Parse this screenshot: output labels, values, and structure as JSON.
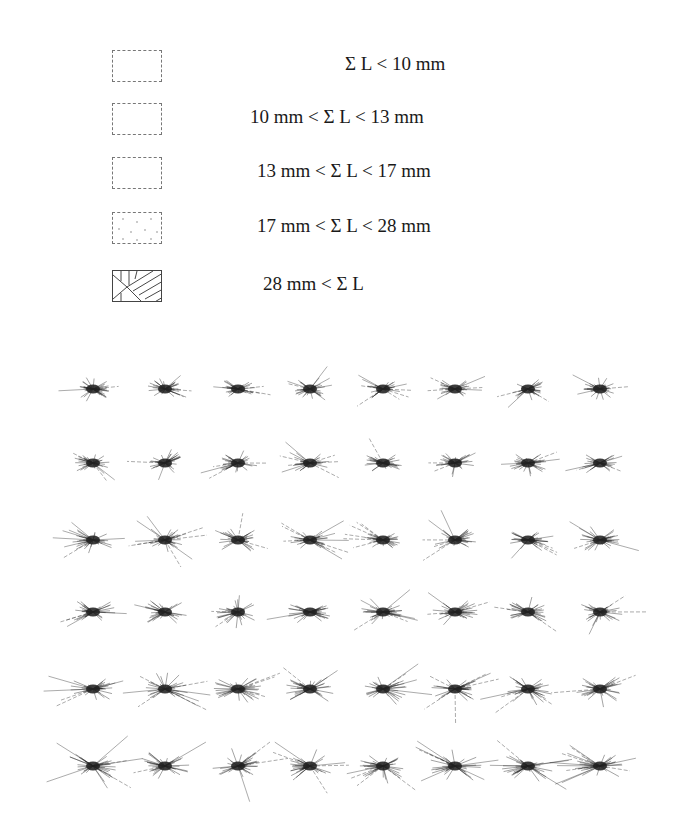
{
  "legend": {
    "items": [
      {
        "label": "Σ L < 10 mm",
        "pattern": "empty-light"
      },
      {
        "label": "10 mm <  Σ L < 13 mm",
        "pattern": "empty-faint-dots"
      },
      {
        "label": "13 mm < Σ L < 17 mm",
        "pattern": "empty-dashed"
      },
      {
        "label": "17 mm < Σ L < 28 mm",
        "pattern": "dotted"
      },
      {
        "label": "28 mm < Σ L",
        "pattern": "hatched"
      }
    ]
  },
  "figure": {
    "rows": 6,
    "cols": 8,
    "row_y": [
      389,
      463,
      540,
      612,
      689,
      766
    ],
    "col_x": [
      93,
      165,
      238,
      310,
      383,
      455,
      528,
      600
    ],
    "stroke_color": "#222222"
  }
}
